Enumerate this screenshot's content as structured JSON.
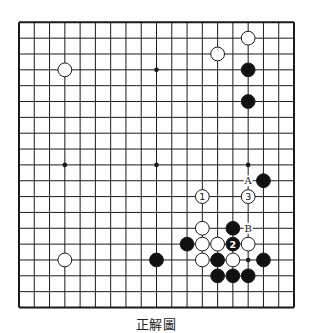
{
  "diagram": {
    "caption": "正解圖",
    "board_size": 19,
    "geometry": {
      "left": 19,
      "top": 22.3,
      "right": 294,
      "bottom": 307.5
    },
    "colors": {
      "line": "#1a1a1a",
      "black": "#111111",
      "white": "#ffffff",
      "stone_edge": "#1a1a1a"
    },
    "star_points": [
      [
        3,
        3
      ],
      [
        9,
        3
      ],
      [
        15,
        3
      ],
      [
        3,
        9
      ],
      [
        9,
        9
      ],
      [
        15,
        9
      ],
      [
        3,
        15
      ],
      [
        9,
        15
      ],
      [
        15,
        15
      ]
    ],
    "stones": [
      {
        "col": 15,
        "row": 1,
        "color": "white",
        "label": ""
      },
      {
        "col": 13,
        "row": 2,
        "color": "white",
        "label": ""
      },
      {
        "col": 15,
        "row": 3,
        "color": "black",
        "label": ""
      },
      {
        "col": 3,
        "row": 3,
        "color": "white",
        "label": ""
      },
      {
        "col": 15,
        "row": 5,
        "color": "black",
        "label": ""
      },
      {
        "col": 16,
        "row": 10,
        "color": "black",
        "label": ""
      },
      {
        "col": 12,
        "row": 11,
        "color": "white",
        "label": "1"
      },
      {
        "col": 15,
        "row": 11,
        "color": "white",
        "label": "3"
      },
      {
        "col": 12,
        "row": 13,
        "color": "white",
        "label": ""
      },
      {
        "col": 14,
        "row": 13,
        "color": "black",
        "label": ""
      },
      {
        "col": 11,
        "row": 14,
        "color": "black",
        "label": ""
      },
      {
        "col": 12,
        "row": 14,
        "color": "white",
        "label": ""
      },
      {
        "col": 13,
        "row": 14,
        "color": "white",
        "label": ""
      },
      {
        "col": 14,
        "row": 14,
        "color": "black",
        "label": "2"
      },
      {
        "col": 15,
        "row": 14,
        "color": "white",
        "label": ""
      },
      {
        "col": 3,
        "row": 15,
        "color": "white",
        "label": ""
      },
      {
        "col": 9,
        "row": 15,
        "color": "black",
        "label": ""
      },
      {
        "col": 12,
        "row": 15,
        "color": "white",
        "label": ""
      },
      {
        "col": 13,
        "row": 15,
        "color": "black",
        "label": ""
      },
      {
        "col": 14,
        "row": 15,
        "color": "white",
        "label": ""
      },
      {
        "col": 16,
        "row": 15,
        "color": "black",
        "label": ""
      },
      {
        "col": 13,
        "row": 16,
        "color": "black",
        "label": ""
      },
      {
        "col": 14,
        "row": 16,
        "color": "black",
        "label": ""
      },
      {
        "col": 15,
        "row": 16,
        "color": "black",
        "label": ""
      }
    ],
    "markers": [
      {
        "col": 15,
        "row": 10,
        "label": "A"
      },
      {
        "col": 15,
        "row": 13,
        "label": "B"
      }
    ]
  }
}
